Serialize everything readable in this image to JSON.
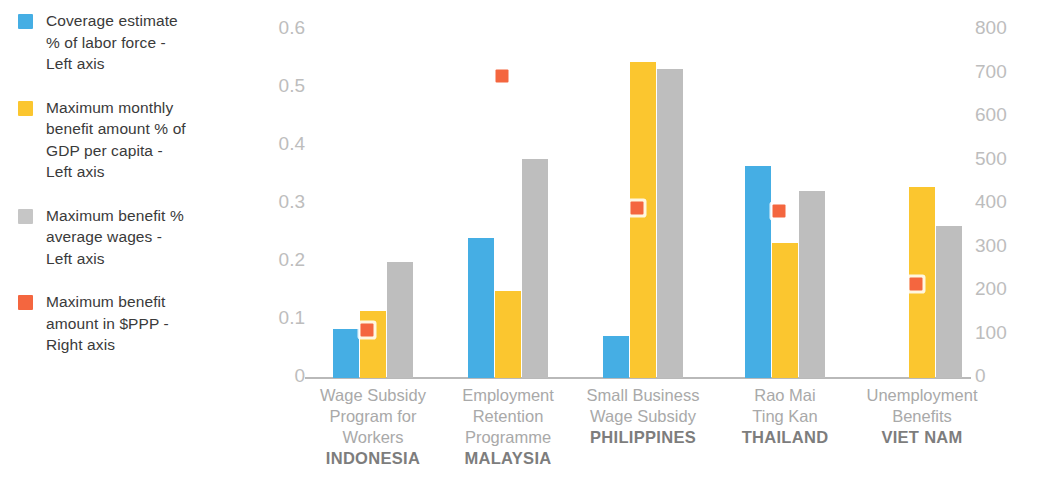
{
  "chart_data": {
    "type": "bar",
    "title": "",
    "xlabel": "",
    "ylabel": "",
    "grid": false,
    "legend_position": "left",
    "categories": [
      {
        "program": [
          "Wage Subsidy",
          "Program for",
          "Workers"
        ],
        "country": "INDONESIA"
      },
      {
        "program": [
          "Employment",
          "Retention",
          "Programme"
        ],
        "country": "MALAYSIA"
      },
      {
        "program": [
          "Small Business",
          "Wage Subsidy"
        ],
        "country": "PHILIPPINES"
      },
      {
        "program": [
          "Rao Mai",
          "Ting Kan"
        ],
        "country": "THAILAND"
      },
      {
        "program": [
          "Unemployment",
          "Benefits"
        ],
        "country": "VIET NAM"
      }
    ],
    "left_axis": {
      "min": 0,
      "max": 0.6,
      "ticks": [
        "0.6",
        "0.5",
        "0.4",
        "0.3",
        "0.2",
        "0.1",
        "0"
      ],
      "tick_values": [
        0.6,
        0.5,
        0.4,
        0.3,
        0.2,
        0.1,
        0
      ]
    },
    "right_axis": {
      "min": 0,
      "max": 800,
      "ticks": [
        "800",
        "700",
        "600",
        "500",
        "400",
        "300",
        "200",
        "100",
        "0"
      ],
      "tick_values": [
        800,
        700,
        600,
        500,
        400,
        300,
        200,
        100,
        0
      ]
    },
    "series": [
      {
        "name": "Coverage estimate % of labor force - Left axis",
        "axis": "left",
        "type": "bar",
        "color": "#45AEE4",
        "values": [
          0.085,
          0.241,
          0.072,
          0.365,
          null
        ]
      },
      {
        "name": "Maximum monthly benefit amount % of GDP per capita - Left axis",
        "axis": "left",
        "type": "bar",
        "color": "#FBC62F",
        "values": [
          0.116,
          0.15,
          0.545,
          0.233,
          0.33
        ]
      },
      {
        "name": "Maximum benefit % average wages - Left axis",
        "axis": "left",
        "type": "bar",
        "color": "#BEBEBE",
        "values": [
          0.2,
          0.378,
          0.533,
          0.322,
          0.262
        ]
      },
      {
        "name": "Maximum benefit amount in $PPP - Right axis",
        "axis": "right",
        "type": "scatter",
        "color": "#F4663F",
        "values": [
          110,
          695,
          390,
          385,
          215
        ]
      }
    ]
  },
  "legend": {
    "items": [
      {
        "color": "#45AEE4",
        "label": "Coverage estimate\n% of labor force -\n Left axis",
        "name": "coverage-estimate"
      },
      {
        "color": "#FBC62F",
        "label": "Maximum monthly\nbenefit amount % of\nGDP per capita -\nLeft axis",
        "name": "max-monthly-benefit"
      },
      {
        "color": "#C6C6C6",
        "label": "Maximum benefit %\naverage wages -\nLeft axis",
        "name": "max-benefit-wages"
      },
      {
        "color": "#F4663F",
        "label": "Maximum benefit\namount in $PPP -\nRight axis",
        "name": "max-benefit-ppp"
      }
    ]
  }
}
